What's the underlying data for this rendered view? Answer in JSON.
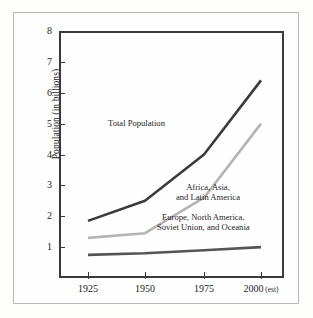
{
  "figure": {
    "background": "#fdfdfc",
    "frame_color": "#3a3a3a",
    "outer_rule_color": "#b8b8b4"
  },
  "axes": {
    "y_axis_label": "Population (in billions)",
    "y_ticks": [
      "8",
      "7",
      "6",
      "5",
      "4",
      "3",
      "2",
      "1"
    ],
    "x_ticks": [
      "1925",
      "1950",
      "1975",
      "2000"
    ],
    "x_last_suffix": "(est)"
  },
  "annotations": {
    "total": "Total Population",
    "developing_line1": "Africa, Asia,",
    "developing_line2": "and Latin America",
    "developed_line1": "Europe, North America,",
    "developed_line2": "Soviet Union, and Oceania"
  },
  "chart_data": {
    "type": "line",
    "title": "",
    "xlabel": "",
    "ylabel": "Population (in billions)",
    "x": [
      "1925",
      "1950",
      "1975",
      "2000"
    ],
    "x_tick_labels": [
      "1925",
      "1950",
      "1975",
      "2000 (est)"
    ],
    "xlim": [
      1912.5,
      2012.5
    ],
    "ylim": [
      0,
      8
    ],
    "grid": false,
    "legend": "inline-annotations",
    "series": [
      {
        "name": "Total Population",
        "values": [
          1.85,
          2.5,
          4.0,
          6.4
        ],
        "color": "#3b3b3b",
        "linewidth": 2.6
      },
      {
        "name": "Africa, Asia, and Latin America",
        "values": [
          1.3,
          1.45,
          2.6,
          5.0
        ],
        "color": "#b4b4b4",
        "linewidth": 2.6
      },
      {
        "name": "Europe, North America, Soviet Union, and Oceania",
        "values": [
          0.75,
          0.8,
          0.9,
          1.0
        ],
        "color": "#555555",
        "linewidth": 2.6
      }
    ]
  }
}
